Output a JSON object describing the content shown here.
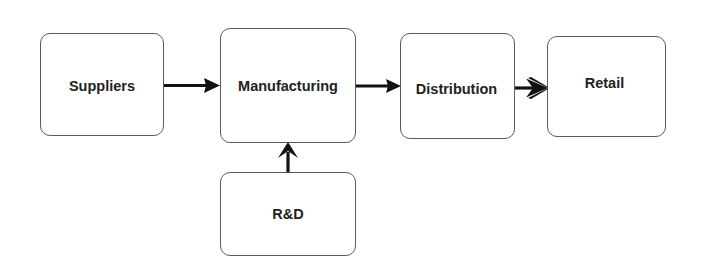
{
  "diagram": {
    "type": "flowchart",
    "direction": "left-to-right",
    "nodes": [
      {
        "id": "suppliers",
        "label": "Suppliers"
      },
      {
        "id": "manufacturing",
        "label": "Manufacturing"
      },
      {
        "id": "distribution",
        "label": "Distribution"
      },
      {
        "id": "retail",
        "label": "Retail"
      },
      {
        "id": "rnd",
        "label": "R&D"
      }
    ],
    "edges": [
      {
        "from": "suppliers",
        "to": "manufacturing"
      },
      {
        "from": "manufacturing",
        "to": "distribution"
      },
      {
        "from": "distribution",
        "to": "retail"
      },
      {
        "from": "rnd",
        "to": "manufacturing"
      }
    ]
  },
  "colors": {
    "node_border": "#5a5a5a",
    "arrow": "#111111",
    "text": "#222222",
    "background": "#ffffff"
  }
}
